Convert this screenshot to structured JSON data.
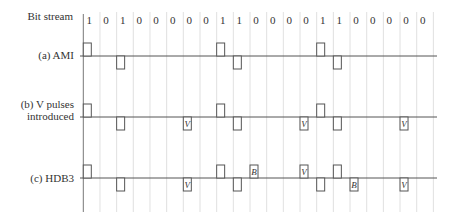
{
  "figure": {
    "bitstream_label": "Bit stream",
    "bits": [
      1,
      0,
      1,
      0,
      0,
      0,
      0,
      0,
      1,
      1,
      0,
      0,
      0,
      0,
      1,
      1,
      0,
      0,
      0,
      0,
      0
    ],
    "rows": [
      {
        "id": "ami",
        "label": "(a) AMI",
        "pulses": [
          {
            "slot": 0,
            "polarity": 1,
            "mark": ""
          },
          {
            "slot": 2,
            "polarity": -1,
            "mark": ""
          },
          {
            "slot": 8,
            "polarity": 1,
            "mark": ""
          },
          {
            "slot": 9,
            "polarity": -1,
            "mark": ""
          },
          {
            "slot": 14,
            "polarity": 1,
            "mark": ""
          },
          {
            "slot": 15,
            "polarity": -1,
            "mark": ""
          }
        ]
      },
      {
        "id": "v-pulses",
        "label_line1": "(b) V pulses",
        "label_line2": "introduced",
        "pulses": [
          {
            "slot": 0,
            "polarity": 1,
            "mark": ""
          },
          {
            "slot": 2,
            "polarity": -1,
            "mark": ""
          },
          {
            "slot": 6,
            "polarity": -1,
            "mark": "V"
          },
          {
            "slot": 8,
            "polarity": 1,
            "mark": ""
          },
          {
            "slot": 9,
            "polarity": -1,
            "mark": ""
          },
          {
            "slot": 13,
            "polarity": -1,
            "mark": "V"
          },
          {
            "slot": 14,
            "polarity": 1,
            "mark": ""
          },
          {
            "slot": 15,
            "polarity": -1,
            "mark": ""
          },
          {
            "slot": 19,
            "polarity": -1,
            "mark": "V"
          }
        ]
      },
      {
        "id": "hdb3",
        "label": "(c) HDB3",
        "pulses": [
          {
            "slot": 0,
            "polarity": 1,
            "mark": ""
          },
          {
            "slot": 2,
            "polarity": -1,
            "mark": ""
          },
          {
            "slot": 6,
            "polarity": -1,
            "mark": "V"
          },
          {
            "slot": 8,
            "polarity": 1,
            "mark": ""
          },
          {
            "slot": 9,
            "polarity": -1,
            "mark": ""
          },
          {
            "slot": 10,
            "polarity": 1,
            "mark": "B"
          },
          {
            "slot": 13,
            "polarity": 1,
            "mark": "V"
          },
          {
            "slot": 14,
            "polarity": -1,
            "mark": ""
          },
          {
            "slot": 15,
            "polarity": 1,
            "mark": ""
          },
          {
            "slot": 16,
            "polarity": -1,
            "mark": "B"
          },
          {
            "slot": 19,
            "polarity": -1,
            "mark": "V"
          }
        ]
      }
    ],
    "colors": {
      "signal": "#555555",
      "grid": "#d8d8d8",
      "text": "#333333"
    }
  }
}
